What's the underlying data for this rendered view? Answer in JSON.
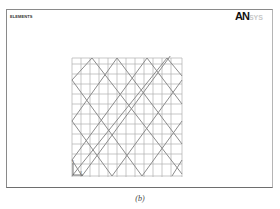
{
  "window": {
    "title": "ELEMENTS",
    "logo": "AN",
    "logo_faded": "SYS"
  },
  "mesh": {
    "type": "shell-lattice",
    "grid_lines_vertical": 13,
    "grid_lines_horizontal": 12,
    "diagonal_pattern": "diamond",
    "line_color": "#a8a8a8",
    "diagonal_color": "#8f8f8f"
  },
  "triad": {
    "axis_y_label": "Y",
    "axis_x_label": "X"
  },
  "caption": "(b)"
}
